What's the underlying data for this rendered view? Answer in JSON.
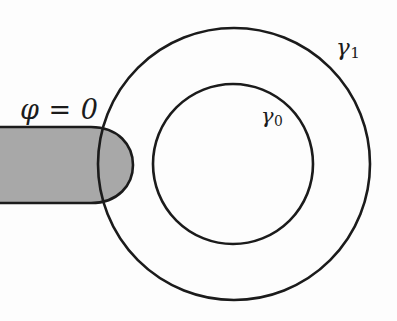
{
  "figure": {
    "kind": "geometry-diagram",
    "background_color": "#fdfdfd",
    "stroke_color": "#1b1b1b",
    "shaded_fill_color": "#a8a8a8",
    "width": 397,
    "height": 321,
    "labels": {
      "boundary_condition": "φ = 0",
      "outer_curve_base": "γ",
      "outer_curve_subscript": "1",
      "inner_curve_base": "γ",
      "inner_curve_subscript": "0"
    }
  },
  "chart_data": {
    "type": "scatter",
    "title": "",
    "xlabel": "",
    "ylabel": "",
    "grid": false,
    "legend": "none",
    "shapes": [
      {
        "name": "outer-circle-gamma-1",
        "type": "circle",
        "cx": 234,
        "cy": 164,
        "r": 136,
        "stroke": "#1b1b1b",
        "stroke_width": 2.6,
        "fill": "none",
        "label": "γ₁"
      },
      {
        "name": "inner-circle-gamma-0",
        "type": "circle",
        "cx": 233,
        "cy": 164,
        "r": 80,
        "stroke": "#1b1b1b",
        "stroke_width": 2.6,
        "fill": "none",
        "label": "γ₀"
      },
      {
        "name": "shaded-dirichlet-region",
        "type": "d-shape",
        "left_x": 53,
        "right_x": 133,
        "top_y": 127,
        "bottom_y": 203,
        "fill": "#a8a8a8",
        "stroke": "#1b1b1b",
        "stroke_width": 2.6,
        "label": "φ = 0"
      }
    ],
    "annotations": [
      {
        "text": "φ = 0",
        "x": 22,
        "y": 110
      },
      {
        "text": "γ₁",
        "x": 348,
        "y": 48
      },
      {
        "text": "γ₀",
        "x": 272,
        "y": 118
      }
    ]
  }
}
